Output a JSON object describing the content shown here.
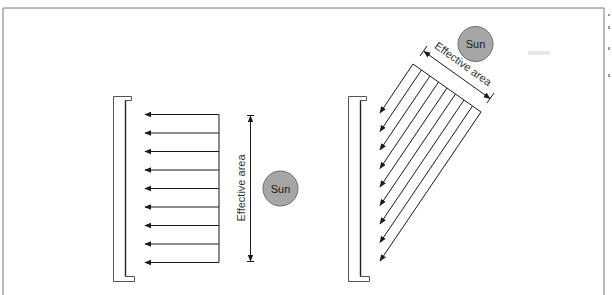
{
  "figure": {
    "colors": {
      "line": "#1a1a1a",
      "frame": "#777777",
      "wall": "#555555",
      "sun_fill": "#a6a6a6",
      "sun_stroke": "#6e6e6e",
      "background": "#ffffff"
    },
    "left_panel": {
      "sun_label": "Sun",
      "dimension_label": "Effective area",
      "ray_count": 9,
      "ray_direction": "horizontal, right-to-left"
    },
    "right_panel": {
      "sun_label": "Sun",
      "dimension_label": "Effective area",
      "ray_count": 9,
      "ray_direction": "diagonal, upper-right to lower-left"
    }
  }
}
